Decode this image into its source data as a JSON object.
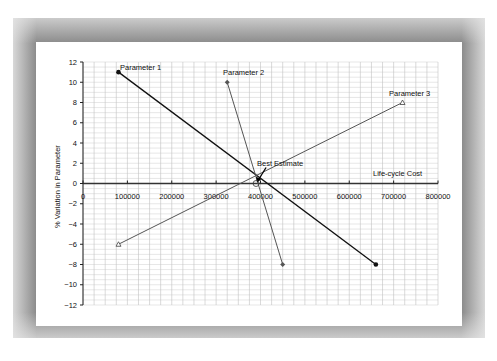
{
  "chart_data": {
    "type": "line",
    "title": "",
    "xlabel": "Life-cycle Cost",
    "ylabel": "% Variation in Parameter",
    "xlim": [
      0,
      800000
    ],
    "ylim": [
      -12,
      12
    ],
    "x_ticks": [
      "0",
      "100000",
      "200000",
      "300000",
      "400000",
      "500000",
      "600000",
      "700000",
      "800000"
    ],
    "y_ticks": [
      "12",
      "10",
      "8",
      "6",
      "4",
      "2",
      "0",
      "-2",
      "-4",
      "-6",
      "-8",
      "-10",
      "-12"
    ],
    "grid": true,
    "legend": "none (series labeled inline)",
    "series": [
      {
        "name": "Parameter 1",
        "marker": "filled-circle",
        "points": [
          [
            80000,
            11
          ],
          [
            660000,
            -8
          ]
        ]
      },
      {
        "name": "Parameter 2",
        "marker": "diamond",
        "points": [
          [
            325000,
            10
          ],
          [
            450000,
            -8
          ]
        ]
      },
      {
        "name": "Parameter 3",
        "marker": "open-triangle",
        "points": [
          [
            80000,
            -6
          ],
          [
            720000,
            8
          ]
        ]
      }
    ],
    "annotations": [
      {
        "text": "Best Estimate",
        "x": 390000,
        "y": 0
      }
    ]
  },
  "labels": {
    "p1": "Parameter 1",
    "p2": "Parameter 2",
    "p3": "Parameter 3",
    "best": "Best Estimate",
    "xlabel": "Life-cycle Cost",
    "ylabel": "% Variation in Parameter"
  }
}
